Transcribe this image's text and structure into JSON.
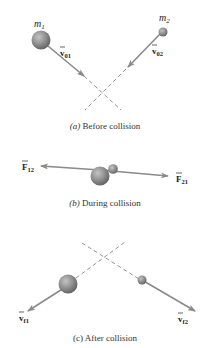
{
  "panels": {
    "a": {
      "caption_prefix": "(a)",
      "caption": " Before collision",
      "mass1_label": "m",
      "mass1_sub": "1",
      "mass2_label": "m",
      "mass2_sub": "2",
      "v1_label": "v",
      "v1_sub": "01",
      "v2_label": "v",
      "v2_sub": "02"
    },
    "b": {
      "caption_prefix": "(b)",
      "caption": " During collision",
      "f1_label": "F",
      "f1_sub": "12",
      "f2_label": "F",
      "f2_sub": "21"
    },
    "c": {
      "caption": "(c) After collision",
      "v1_label": "v",
      "v1_sub": "f1",
      "v2_label": "v",
      "v2_sub": "f2"
    }
  },
  "colors": {
    "ball": "#8c8c8c",
    "arrow": "#8a8a8a",
    "dashed": "#7a7a7a"
  }
}
